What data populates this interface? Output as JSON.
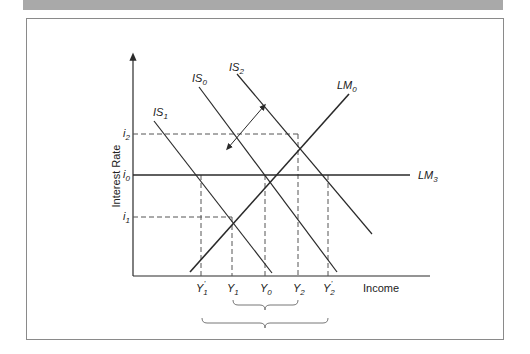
{
  "figure": {
    "title": "",
    "ylabel": "Interest Rate",
    "xlabel": "Income"
  },
  "curves": {
    "is0": {
      "base": "IS",
      "sub": "0"
    },
    "is1": {
      "base": "IS",
      "sub": "1"
    },
    "is2": {
      "base": "IS",
      "sub": "2"
    },
    "lm0": {
      "base": "LM",
      "sub": "0"
    },
    "lm3": {
      "base": "LM",
      "sub": "3"
    }
  },
  "y_ticks": {
    "i2": {
      "base": "i",
      "sub": "2"
    },
    "i0": {
      "base": "i",
      "sub": "0"
    },
    "i1": {
      "base": "i",
      "sub": "1"
    }
  },
  "x_ticks": {
    "y1p": {
      "base": "Y",
      "sub": "1",
      "prime": "'"
    },
    "y1": {
      "base": "Y",
      "sub": "1"
    },
    "y0": {
      "base": "Y",
      "sub": "0"
    },
    "y2": {
      "base": "Y",
      "sub": "2"
    },
    "y2p": {
      "base": "Y",
      "sub": "2",
      "prime": "'"
    }
  },
  "colors": {
    "line": "#2a2a2a",
    "dashed": "#555555",
    "frame": "#8a8a8a",
    "topbar": "#a9a9a9"
  }
}
